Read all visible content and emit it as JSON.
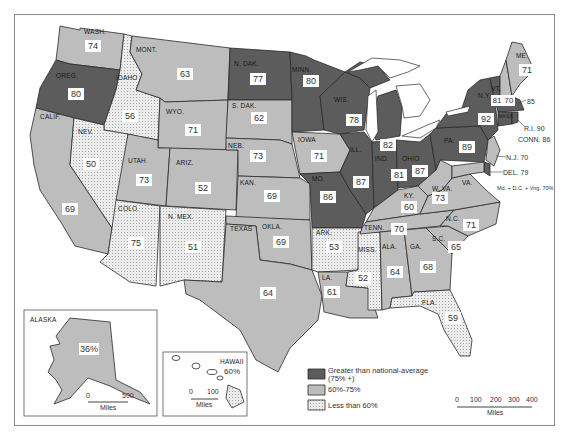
{
  "map": {
    "title": "Percent of population by state relative to national average",
    "states": [
      {
        "abbr": "WASH.",
        "value": "74",
        "category": "mid"
      },
      {
        "abbr": "OREG.",
        "value": "80",
        "category": "dark"
      },
      {
        "abbr": "CALIF.",
        "value": "69",
        "category": "mid"
      },
      {
        "abbr": "IDAHO",
        "value": "56",
        "category": "light"
      },
      {
        "abbr": "NEV.",
        "value": "50",
        "category": "light"
      },
      {
        "abbr": "MONT.",
        "value": "63",
        "category": "mid"
      },
      {
        "abbr": "WYO.",
        "value": "71",
        "category": "mid"
      },
      {
        "abbr": "UTAH",
        "value": "73",
        "category": "mid"
      },
      {
        "abbr": "ARIZ.",
        "value": "52",
        "category": "light"
      },
      {
        "abbr": "COLO.",
        "value": "75",
        "category": "mid"
      },
      {
        "abbr": "N. MEX.",
        "value": "51",
        "category": "light"
      },
      {
        "abbr": "N. DAK.",
        "value": "77",
        "category": "dark"
      },
      {
        "abbr": "S. DAK.",
        "value": "62",
        "category": "mid"
      },
      {
        "abbr": "NEB.",
        "value": "73",
        "category": "mid"
      },
      {
        "abbr": "KAN.",
        "value": "69",
        "category": "mid"
      },
      {
        "abbr": "OKLA.",
        "value": "69",
        "category": "mid"
      },
      {
        "abbr": "TEXAS",
        "value": "64",
        "category": "mid"
      },
      {
        "abbr": "MINN.",
        "value": "80",
        "category": "dark"
      },
      {
        "abbr": "IOWA",
        "value": "71",
        "category": "mid"
      },
      {
        "abbr": "MO.",
        "value": "86",
        "category": "dark"
      },
      {
        "abbr": "ARK.",
        "value": "53",
        "category": "light"
      },
      {
        "abbr": "LA.",
        "value": "61",
        "category": "mid"
      },
      {
        "abbr": "WIS.",
        "value": "78",
        "category": "dark"
      },
      {
        "abbr": "ILL.",
        "value": "87",
        "category": "dark"
      },
      {
        "abbr": "MISS.",
        "value": "52",
        "category": "light"
      },
      {
        "abbr": "MICH.",
        "value": "82",
        "category": "dark"
      },
      {
        "abbr": "IND.",
        "value": "81",
        "category": "dark"
      },
      {
        "abbr": "OHIO",
        "value": "87",
        "category": "dark"
      },
      {
        "abbr": "KY.",
        "value": "60",
        "category": "mid"
      },
      {
        "abbr": "TENN.",
        "value": "70",
        "category": "mid"
      },
      {
        "abbr": "ALA.",
        "value": "64",
        "category": "mid"
      },
      {
        "abbr": "GA.",
        "value": "68",
        "category": "mid"
      },
      {
        "abbr": "FLA.",
        "value": "59",
        "category": "light"
      },
      {
        "abbr": "S.C.",
        "value": "65",
        "category": "mid"
      },
      {
        "abbr": "N.C.",
        "value": "71",
        "category": "mid"
      },
      {
        "abbr": "VA.",
        "value": "",
        "category": "mid"
      },
      {
        "abbr": "W. VA.",
        "value": "73",
        "category": "mid"
      },
      {
        "abbr": "PA.",
        "value": "89",
        "category": "dark"
      },
      {
        "abbr": "N.Y.",
        "value": "92",
        "category": "dark"
      },
      {
        "abbr": "VT.",
        "value": "81",
        "category": "dark"
      },
      {
        "abbr": "N.H.",
        "value": "70",
        "category": "mid"
      },
      {
        "abbr": "ME.",
        "value": "71",
        "category": "mid"
      },
      {
        "abbr": "MASS.",
        "value": "",
        "category": "dark"
      }
    ],
    "callouts": {
      "mass": "85",
      "ri": "R.I. 90",
      "conn": "CONN. 86",
      "nj": "N.J. 70",
      "del": "DEL. 79",
      "md": "Md. + D.C. + Virg. 70%"
    },
    "insets": {
      "alaska": {
        "label": "ALASKA",
        "value": "36%",
        "scale": {
          "ticks": [
            "0",
            "500"
          ],
          "unit": "Miles"
        }
      },
      "hawaii": {
        "label": "HAWAII",
        "value": "60%",
        "scale": {
          "ticks": [
            "0",
            "100"
          ],
          "unit": "Miles"
        }
      }
    },
    "legend": {
      "items": [
        {
          "label": "Greater than national-average",
          "sublabel": "(75% +)",
          "swatch": "dark"
        },
        {
          "label": "60%-75%",
          "swatch": "mid"
        },
        {
          "label": "Less than 60%",
          "swatch": "light"
        }
      ]
    },
    "scale": {
      "ticks": [
        "0",
        "100",
        "200",
        "300",
        "400"
      ],
      "unit": "Miles"
    },
    "colors": {
      "dark": "#5c5c5c",
      "mid": "#bdbdbd",
      "light": "#e4e4e4",
      "border": "#2a2a2a"
    }
  }
}
